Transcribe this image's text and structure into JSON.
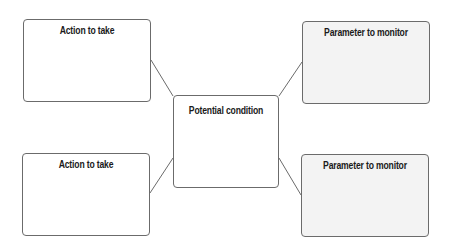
{
  "diagram": {
    "center": {
      "label": "Potential condition"
    },
    "nodes": [
      {
        "id": "top-left",
        "label": "Action to take"
      },
      {
        "id": "top-right",
        "label": "Parameter to monitor"
      },
      {
        "id": "bottom-left",
        "label": "Action to take"
      },
      {
        "id": "bottom-right",
        "label": "Parameter to monitor"
      }
    ],
    "edges": [
      {
        "from": "top-left",
        "to": "center"
      },
      {
        "from": "top-right",
        "to": "center"
      },
      {
        "from": "bottom-left",
        "to": "center"
      },
      {
        "from": "bottom-right",
        "to": "center"
      }
    ],
    "colors": {
      "border": "#6b6b6b",
      "action_fill": "#ffffff",
      "parameter_fill": "#f3f3f3",
      "text": "#1a1a1a"
    }
  }
}
